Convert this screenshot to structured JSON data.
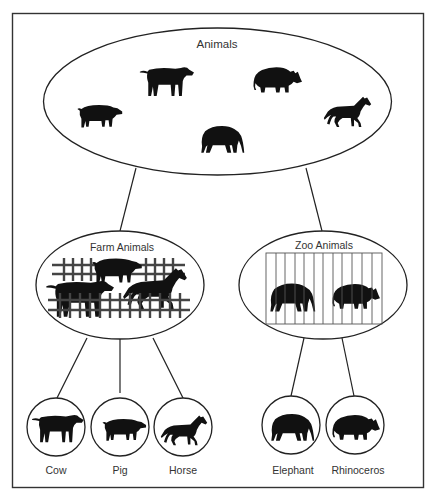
{
  "diagram": {
    "root": {
      "label": "Animals",
      "animals": [
        "cow",
        "rhinoceros",
        "pig",
        "elephant",
        "horse"
      ]
    },
    "categories": [
      {
        "label": "Farm Animals",
        "enclosure": "fence",
        "children": [
          "Cow",
          "Pig",
          "Horse"
        ]
      },
      {
        "label": "Zoo Animals",
        "enclosure": "cage",
        "children": [
          "Elephant",
          "Rhinoceros"
        ]
      }
    ],
    "leaves": [
      {
        "label": "Cow",
        "icon": "cow-icon"
      },
      {
        "label": "Pig",
        "icon": "pig-icon"
      },
      {
        "label": "Horse",
        "icon": "horse-icon"
      },
      {
        "label": "Elephant",
        "icon": "elephant-icon"
      },
      {
        "label": "Rhinoceros",
        "icon": "rhinoceros-icon"
      }
    ],
    "colors": {
      "line": "#222222",
      "silhouette": "#111111",
      "background": "#ffffff"
    }
  }
}
